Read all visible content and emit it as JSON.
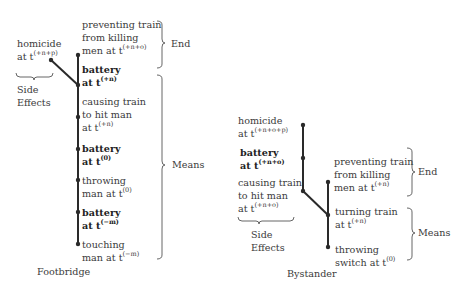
{
  "footbridge": {
    "caption": "Footbridge",
    "side_effect": {
      "label": "Side Effects",
      "line1": "homicide",
      "line2_prefix": "at t",
      "line2_sup": "(+n+p)"
    },
    "end_label": "End",
    "means_label": "Means",
    "chain": [
      {
        "bold": false,
        "line1": "preventing train",
        "line2": "from killing",
        "line3_prefix": "men at t",
        "sup": "(+n+o)"
      },
      {
        "bold": true,
        "line1": "battery",
        "line2_prefix": "at t",
        "sup": "(+n)"
      },
      {
        "bold": false,
        "line1": "causing train",
        "line2": "to hit man",
        "line3_prefix": "at t",
        "sup": "(+n)"
      },
      {
        "bold": true,
        "line1": "battery",
        "line2_prefix": "at t",
        "sup": "(0)"
      },
      {
        "bold": false,
        "line1": "throwing",
        "line2_prefix": "man at t",
        "sup": "(0)"
      },
      {
        "bold": true,
        "line1": "battery",
        "line2_prefix": "at t",
        "sup": "(−m)"
      },
      {
        "bold": false,
        "line1": "touching",
        "line2_prefix": "man at t",
        "sup": "(−m)"
      }
    ]
  },
  "bystander": {
    "caption": "Bystander",
    "side_effects_label": "Side Effects",
    "side_chain": [
      {
        "bold": false,
        "line1": "homicide",
        "line2_prefix": "at t",
        "sup": "(+n+o+p)"
      },
      {
        "bold": true,
        "line1": "battery",
        "line2_prefix": "at t",
        "sup": "(+n+o)"
      },
      {
        "bold": false,
        "line1": "causing train",
        "line2": "to hit man",
        "line3_prefix": "at t",
        "sup": "(+n+o)"
      }
    ],
    "end_label": "End",
    "means_label": "Means",
    "chain": [
      {
        "bold": false,
        "line1": "preventing train",
        "line2": "from killing",
        "line3_prefix": "men at t",
        "sup": "(+n)"
      },
      {
        "bold": false,
        "line1": "turning train",
        "line2_prefix": "at t",
        "sup": "(+n)"
      },
      {
        "bold": false,
        "line1": "throwing",
        "line2_prefix": "switch at t",
        "sup": "(0)"
      }
    ]
  },
  "colors": {
    "line": "#2a2a2a",
    "text": "#3a3a3a",
    "brace": "#555555"
  }
}
